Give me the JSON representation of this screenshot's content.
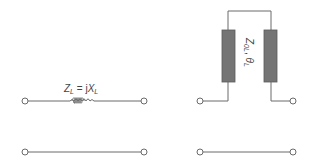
{
  "diagram": {
    "title": "",
    "left_circuit": {
      "description": "Series inductor equivalent",
      "label_main": "Z",
      "label_sub": "L",
      "label_eq": " = j",
      "label_main2": "X",
      "label_sub2": "L",
      "element": "inductor"
    },
    "right_circuit": {
      "description": "Series short-circuited stub pair",
      "label_main": "Z",
      "label_sub": "0L",
      "label_sep": ", ",
      "label_theta": "θ",
      "label_theta_sub": "L",
      "element": "transmission-line-stubs"
    },
    "colors": {
      "wire": "#6a6a6a",
      "stub_fill": "#757575",
      "text": "#444444"
    }
  }
}
